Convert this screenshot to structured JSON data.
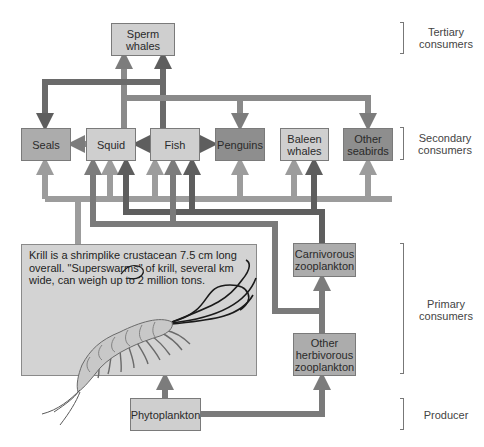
{
  "diagram": {
    "nodes": {
      "sperm_whales": "Sperm\nwhales",
      "seals": "Seals",
      "squid": "Squid",
      "fish": "Fish",
      "penguins": "Penguins",
      "baleen_whales": "Baleen\nwhales",
      "other_seabirds": "Other\nseabirds",
      "carnivorous_zooplankton": "Carnivorous\nzooplankton",
      "other_herbivorous_zooplankton": "Other\nherbivorous\nzooplankton",
      "phytoplankton": "Phytoplankton"
    },
    "krill_caption": "Krill is a shrimplike crustacean 7.5 cm long overall. \"Superswarms\" of krill, several km wide, can weigh up to 2 million tons.",
    "levels": {
      "tertiary": "Tertiary\nconsumers",
      "secondary": "Secondary\nconsumers",
      "primary": "Primary\nconsumers",
      "producer": "Producer"
    },
    "edges": [
      {
        "from": "Squid",
        "to": "Sperm whales"
      },
      {
        "from": "Fish",
        "to": "Sperm whales"
      },
      {
        "from": "Fish",
        "to": "Seals"
      },
      {
        "from": "Squid",
        "to": "Penguins"
      },
      {
        "from": "Squid",
        "to": "Other seabirds"
      },
      {
        "from": "Squid",
        "to": "Seals"
      },
      {
        "from": "Fish",
        "to": "Squid"
      },
      {
        "from": "Fish",
        "to": "Penguins"
      },
      {
        "from": "Krill",
        "to": "Seals"
      },
      {
        "from": "Krill",
        "to": "Squid"
      },
      {
        "from": "Krill",
        "to": "Fish"
      },
      {
        "from": "Krill",
        "to": "Penguins"
      },
      {
        "from": "Krill",
        "to": "Baleen whales"
      },
      {
        "from": "Krill",
        "to": "Other seabirds"
      },
      {
        "from": "Krill",
        "to": "Carnivorous zooplankton"
      },
      {
        "from": "Carnivorous zooplankton",
        "to": "Squid"
      },
      {
        "from": "Carnivorous zooplankton",
        "to": "Fish"
      },
      {
        "from": "Carnivorous zooplankton",
        "to": "Baleen whales"
      },
      {
        "from": "Other herbivorous zooplankton",
        "to": "Squid"
      },
      {
        "from": "Other herbivorous zooplankton",
        "to": "Fish"
      },
      {
        "from": "Other herbivorous zooplankton",
        "to": "Carnivorous zooplankton"
      },
      {
        "from": "Phytoplankton",
        "to": "Krill"
      },
      {
        "from": "Phytoplankton",
        "to": "Other herbivorous zooplankton"
      }
    ],
    "colors": {
      "arrow_light": "#9c9c9c",
      "arrow_mid": "#7c7c7c",
      "arrow_dark": "#5e5e5e",
      "box_light": "#cfcfcf",
      "box_mid": "#acacac",
      "box_dark": "#8e8e8e"
    }
  }
}
